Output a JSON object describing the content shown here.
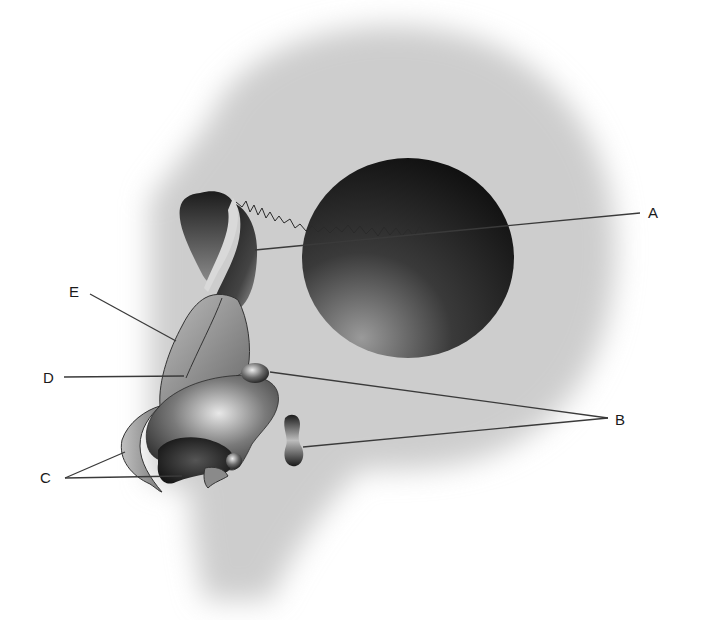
{
  "figure": {
    "type": "anatomical-diagram",
    "view": "lateral head silhouette with nasal and facial structures",
    "palette": {
      "background": "#ffffff",
      "head_silhouette": "#cfcfcf",
      "orbit_dark": "#141414",
      "orbit_light": "#8a8a8a",
      "structure_dark": "#2a2a2a",
      "structure_mid": "#7a7a7a",
      "structure_light": "#c8c8c8",
      "leader_line": "#3a3a3a",
      "label_text": "#1a1a1a"
    }
  },
  "labels": [
    {
      "id": "A",
      "text": "A",
      "x": 648,
      "y": 205
    },
    {
      "id": "B",
      "text": "B",
      "x": 615,
      "y": 412
    },
    {
      "id": "C",
      "text": "C",
      "x": 40,
      "y": 470
    },
    {
      "id": "D",
      "text": "D",
      "x": 43,
      "y": 370
    },
    {
      "id": "E",
      "text": "E",
      "x": 69,
      "y": 284
    }
  ],
  "leaders": [
    {
      "label": "A",
      "segments": [
        [
          [
            640,
            213
          ],
          [
            255,
            250
          ]
        ]
      ]
    },
    {
      "label": "B",
      "segments": [
        [
          [
            608,
            418
          ],
          [
            270,
            372
          ]
        ],
        [
          [
            608,
            418
          ],
          [
            303,
            447
          ]
        ]
      ]
    },
    {
      "label": "C",
      "segments": [
        [
          [
            65,
            478
          ],
          [
            125,
            452
          ]
        ],
        [
          [
            65,
            478
          ],
          [
            182,
            476
          ]
        ]
      ]
    },
    {
      "label": "D",
      "segments": [
        [
          [
            64,
            377
          ],
          [
            184,
            376
          ]
        ]
      ]
    },
    {
      "label": "E",
      "segments": [
        [
          [
            90,
            294
          ],
          [
            176,
            341
          ]
        ]
      ]
    }
  ]
}
